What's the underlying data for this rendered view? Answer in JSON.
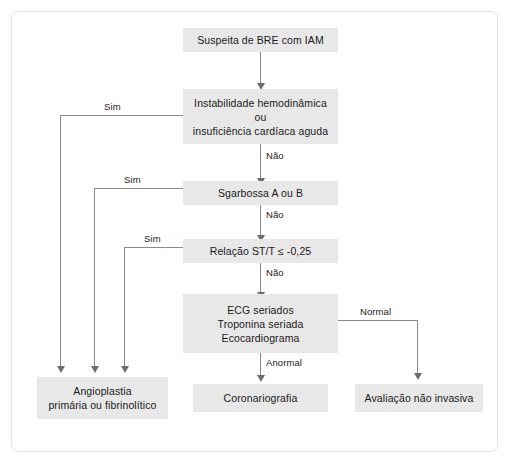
{
  "diagram": {
    "title_text": "Suspeita de BRE com IAM",
    "nodes": [
      {
        "id": "start",
        "label_lines": [
          "Suspeita de BRE com IAM"
        ]
      },
      {
        "id": "instab",
        "label_lines": [
          "Instabilidade hemodinâmica",
          "ou",
          "insuficiência cardíaca aguda"
        ]
      },
      {
        "id": "sgarbossa",
        "label_lines": [
          "Sgarbossa A ou B"
        ]
      },
      {
        "id": "relacao",
        "label_lines": [
          "Relação ST/T ≤ -0,25"
        ]
      },
      {
        "id": "seriados",
        "label_lines": [
          "ECG seriados",
          "Troponina seriada",
          "Ecocardiograma"
        ]
      },
      {
        "id": "angio",
        "label_lines": [
          "Angioplastia",
          "primária ou fibrinolítico"
        ]
      },
      {
        "id": "corona",
        "label_lines": [
          "Coronariografia"
        ]
      },
      {
        "id": "avaliacao",
        "label_lines": [
          "Avaliação não invasiva"
        ]
      }
    ],
    "edge_labels": {
      "sim_1": "Sim",
      "sim_2": "Sim",
      "sim_3": "Sim",
      "nao_1": "Não",
      "nao_2": "Não",
      "nao_3": "Não",
      "anormal": "Anormal",
      "normal": "Normal"
    },
    "colors": {
      "node_fill": "#e8e8e8",
      "edge_line": "#8a8a8a",
      "frame_border": "#e3e3e3",
      "text": "#1a1a1a",
      "page_background": "#ffffff"
    }
  }
}
